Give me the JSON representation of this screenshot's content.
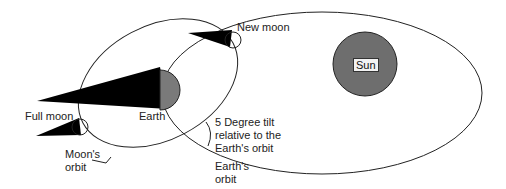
{
  "diagram": {
    "title": "",
    "labels": {
      "new_moon": "New moon",
      "sun": "Sun",
      "earth": "Earth",
      "full_moon": "Full moon",
      "moons_orbit_line1": "Moon's",
      "moons_orbit_line2": "orbit",
      "tilt_line1": "5 Degree tilt",
      "tilt_line2": "relative to the",
      "tilt_line3": "Earth's orbit",
      "earths_orbit_line1": "Earth's",
      "earths_orbit_line2": "orbit"
    },
    "colors": {
      "sun_fill": "#6e6e6e",
      "earth_fill": "#7a7a7a",
      "shadow": "#000000",
      "orbit_stroke": "#222222"
    },
    "nodes": [
      {
        "id": "sun",
        "label": "Sun",
        "shape": "circle"
      },
      {
        "id": "earth",
        "label": "Earth",
        "shape": "circle"
      },
      {
        "id": "new-moon",
        "label": "New moon",
        "shape": "circle"
      },
      {
        "id": "full-moon",
        "label": "Full moon",
        "shape": "circle"
      }
    ],
    "edges": [
      {
        "from": "earth",
        "to": "sun",
        "label": "Earth's orbit"
      },
      {
        "from": "new-moon",
        "to": "earth",
        "label": "Moon's orbit"
      },
      {
        "from": "full-moon",
        "to": "earth",
        "label": "Moon's orbit"
      }
    ],
    "annotation": "5 Degree tilt relative to the Earth's orbit"
  }
}
